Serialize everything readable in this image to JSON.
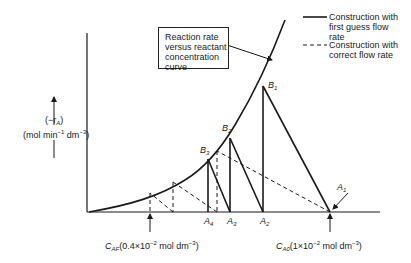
{
  "diagram": {
    "type": "graphical-cstr-cascade-construction",
    "y_axis": {
      "label_symbol": "(−r",
      "label_sub": "A",
      "label_close": ")",
      "units_prefix": "(mol min",
      "units_exp1": "−1",
      "units_mid": " dm",
      "units_exp2": "−3",
      "units_close": ")"
    },
    "curve_box": {
      "line1": "Reaction rate",
      "line2": "versus reactant",
      "line3": "concentration",
      "line4": "curve"
    },
    "legend": [
      {
        "style": "solid",
        "line1": "Construction with",
        "line2": "first guess flow",
        "line3": "rate"
      },
      {
        "style": "dashed",
        "line1": "Construction with",
        "line2": "correct flow rate"
      }
    ],
    "points": {
      "B1": {
        "letter": "B",
        "sub": "1"
      },
      "B2": {
        "letter": "B",
        "sub": "2"
      },
      "B3": {
        "letter": "B",
        "sub": "3"
      },
      "A1": {
        "letter": "A",
        "sub": "1"
      },
      "A2": {
        "letter": "A",
        "sub": "2"
      },
      "A3": {
        "letter": "A",
        "sub": "3"
      },
      "A4": {
        "letter": "A",
        "sub": "4"
      }
    },
    "caf": {
      "sym": "C",
      "sub": "AF",
      "text_a": "(0.4×10",
      "exp": "−2",
      "text_b": " mol dm",
      "exp2": "−3",
      "text_c": ")"
    },
    "ca0": {
      "sym": "C",
      "sub": "A0",
      "text_a": "(1×10",
      "exp": "−2",
      "text_b": " mol dm",
      "exp2": "−3",
      "text_c": ")"
    },
    "colors": {
      "line": "#1a1a1a",
      "background": "#ffffff"
    }
  }
}
